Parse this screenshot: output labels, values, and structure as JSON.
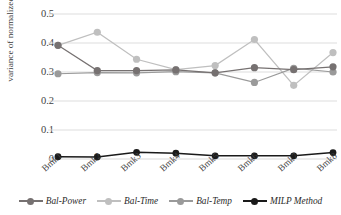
{
  "chart_data": {
    "type": "line",
    "title": "",
    "xlabel": "",
    "ylabel": "variance of normalized MTTs",
    "categories": [
      "Bmk1",
      "Bmk2",
      "Bmk3",
      "Bmk4",
      "Bmk5",
      "Bmk6",
      "Bmk7",
      "Bmk8"
    ],
    "ylim": [
      0,
      0.5
    ],
    "yticks": [
      "0",
      "0.1",
      "0.2",
      "0.3",
      "0.4",
      "0.5"
    ],
    "ytick_values": [
      0,
      0.1,
      0.2,
      0.3,
      0.4,
      0.5
    ],
    "grid": true,
    "grid_axis": "y",
    "legend_position": "bottom",
    "series": [
      {
        "name": "Bal-Power",
        "color": "#767171",
        "values": [
          0.392,
          0.305,
          0.305,
          0.307,
          0.297,
          0.315,
          0.308,
          0.318
        ]
      },
      {
        "name": "Bal-Time",
        "color": "#bfbfbf",
        "values": [
          0.392,
          0.437,
          0.344,
          0.308,
          0.322,
          0.412,
          0.254,
          0.367
        ]
      },
      {
        "name": "Bal-Temp",
        "color": "#9a9a9a",
        "values": [
          0.294,
          0.298,
          0.297,
          0.301,
          0.297,
          0.264,
          0.313,
          0.3
        ]
      },
      {
        "name": "MILP Method",
        "color": "#1a1a1a",
        "values": [
          0.008,
          0.007,
          0.023,
          0.02,
          0.011,
          0.011,
          0.011,
          0.022
        ]
      }
    ]
  },
  "legend": {
    "items": [
      {
        "label": "Bal-Power",
        "color": "#767171"
      },
      {
        "label": "Bal-Time",
        "color": "#bfbfbf"
      },
      {
        "label": "Bal-Temp",
        "color": "#9a9a9a"
      },
      {
        "label": "MILP Method",
        "color": "#1a1a1a"
      }
    ]
  },
  "axes": {
    "y_title": "variance of normalized MTTs"
  },
  "colors": {
    "gridline": "#d9d9d9",
    "axis_text": "#3f3f3f",
    "background": "#ffffff"
  }
}
